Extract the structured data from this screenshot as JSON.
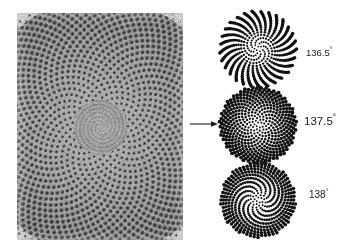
{
  "figure": {
    "type": "phyllotaxis-comparison",
    "background_color": "#ffffff",
    "text_color": "#1b1b1b"
  },
  "photo": {
    "label": "Sunflower seed head photograph",
    "description": "Grayscale photograph of a sunflower capitulum showing interlocking parastichy spirals of florets",
    "grayscale": true,
    "x": 17,
    "y": 13,
    "width": 166,
    "height": 227
  },
  "arrow": {
    "name": "right-arrow",
    "direction": "right",
    "color": "#1b1b1b"
  },
  "panels": [
    {
      "id": "spiral-0",
      "angle_label": "136.5",
      "degree_symbol": "°",
      "angle_value": 136.5,
      "points": 480,
      "dot_radius": 1.55,
      "radius_scale": 1.76,
      "dot_color": "#111111",
      "pattern": "radial spoke arms visible"
    },
    {
      "id": "spiral-1",
      "angle_label": "137.5",
      "degree_symbol": "°",
      "angle_value": 137.5,
      "points": 470,
      "dot_radius": 1.7,
      "radius_scale": 1.78,
      "dot_color": "#111111",
      "pattern": "uniform golden-angle packing, no gaps"
    },
    {
      "id": "spiral-2",
      "angle_label": "138",
      "degree_symbol": "°",
      "angle_value": 138.0,
      "points": 470,
      "dot_radius": 1.6,
      "radius_scale": 1.74,
      "dot_color": "#111111",
      "pattern": "thick curved spiral arms with wide gaps"
    }
  ],
  "chart_data": {
    "type": "scatter",
    "title": "",
    "xlabel": "",
    "ylabel": "",
    "series": [
      {
        "name": "136.5°",
        "divergence_angle_deg": 136.5,
        "n_points": 480
      },
      {
        "name": "137.5°",
        "divergence_angle_deg": 137.5,
        "n_points": 470
      },
      {
        "name": "138°",
        "divergence_angle_deg": 138.0,
        "n_points": 470
      }
    ],
    "legend_position": "right",
    "grid": false
  }
}
